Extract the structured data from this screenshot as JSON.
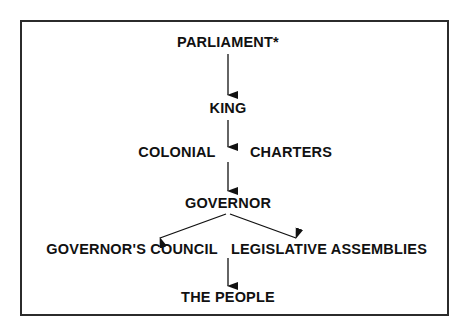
{
  "diagram": {
    "title_note": "PARLIAMENT*",
    "frame": {
      "border_color": "#2b2b2b",
      "background_color": "#ffffff"
    },
    "text_color": "#111111",
    "nodes": [
      {
        "id": "parliament",
        "label": "PARLIAMENT*",
        "level": 1
      },
      {
        "id": "king",
        "label": "KING",
        "level": 2
      },
      {
        "id": "colonial",
        "label": "COLONIAL",
        "level": 3
      },
      {
        "id": "charters",
        "label": "CHARTERS",
        "level": 3
      },
      {
        "id": "governor",
        "label": "GOVERNOR",
        "level": 4
      },
      {
        "id": "governors-council",
        "label": "GOVERNOR'S COUNCIL",
        "level": 5
      },
      {
        "id": "legislative-assemblies",
        "label": "LEGISLATIVE ASSEMBLIES",
        "level": 5
      },
      {
        "id": "the-people",
        "label": "THE PEOPLE",
        "level": 6
      }
    ],
    "edges": [
      {
        "from": "parliament",
        "to": "king",
        "style": "arrow-down"
      },
      {
        "from": "king",
        "to": "colonial-charters",
        "style": "arrow-down"
      },
      {
        "from": "colonial-charters",
        "to": "governor",
        "style": "arrow-down"
      },
      {
        "from": "governor",
        "to": "governors-council",
        "style": "arrow-diagonal-left"
      },
      {
        "from": "governor",
        "to": "legislative-assemblies",
        "style": "arrow-diagonal-right"
      },
      {
        "from": "assemblies-level",
        "to": "the-people",
        "style": "arrow-down"
      }
    ]
  }
}
